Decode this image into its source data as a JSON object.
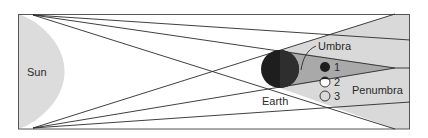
{
  "diagram": {
    "labels": {
      "sun": "Sun",
      "earth": "Earth",
      "umbra": "Umbra",
      "penumbra": "Penumbra"
    },
    "moon_positions": [
      {
        "id": "1",
        "label": "1",
        "state": "filled"
      },
      {
        "id": "2",
        "label": "2",
        "state": "partial"
      },
      {
        "id": "3",
        "label": "3",
        "state": "outline"
      }
    ],
    "colors": {
      "sun_fill": "#dcdcdc",
      "penumbra_fill": "#d9d9d9",
      "umbra_fill": "#a9a9a9",
      "earth_fill": "#1e1e1e",
      "line": "#2a2a2a",
      "frame": "#555555"
    }
  }
}
